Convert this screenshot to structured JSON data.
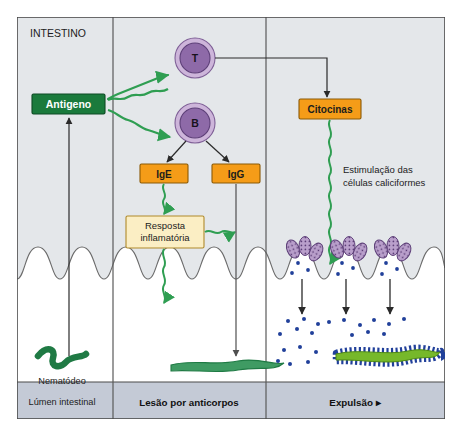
{
  "figure": {
    "title_label": "INTESTINO",
    "colors": {
      "panel_bg": "#e2e5e8",
      "lumen_bg": "#ffffff",
      "antigen_box": "#1a7a3c",
      "antigen_text": "#ffffff",
      "orange_box": "#f59c18",
      "orange_border": "#8a5a06",
      "cream_box": "#fbeec4",
      "cream_border": "#b08a2a",
      "cell_fill": "#8e6aa8",
      "cell_ring": "#c9b0d8",
      "green_arrow": "#2f9e52",
      "black_arrow": "#2a2a2a",
      "worm_dark": "#1f7a44",
      "worm_bright": "#76b82a",
      "antibody_blue": "#21409a",
      "footer_bg": "#c3c9d6",
      "frame": "#4a4a4a"
    },
    "panels": [
      {
        "name": "panel-left",
        "footer_label": ""
      },
      {
        "name": "panel-middle",
        "footer_label": "Lesão por anticorpos"
      },
      {
        "name": "panel-right",
        "footer_label": "Expulsão  ▸"
      }
    ],
    "nodes": {
      "antigen": "Antigeno",
      "t_cell": "T",
      "b_cell": "B",
      "ige": "IgE",
      "igg": "IgG",
      "inflammatory_response_line1": "Resposta",
      "inflammatory_response_line2": "inflamatória",
      "cytokines": "Citocinas",
      "stimulation_line1": "Estimulação das",
      "stimulation_line2": "células caliciformes"
    },
    "annotations": {
      "nematode": "Nematódeo",
      "lumen": "Lúmen intestinal"
    }
  }
}
